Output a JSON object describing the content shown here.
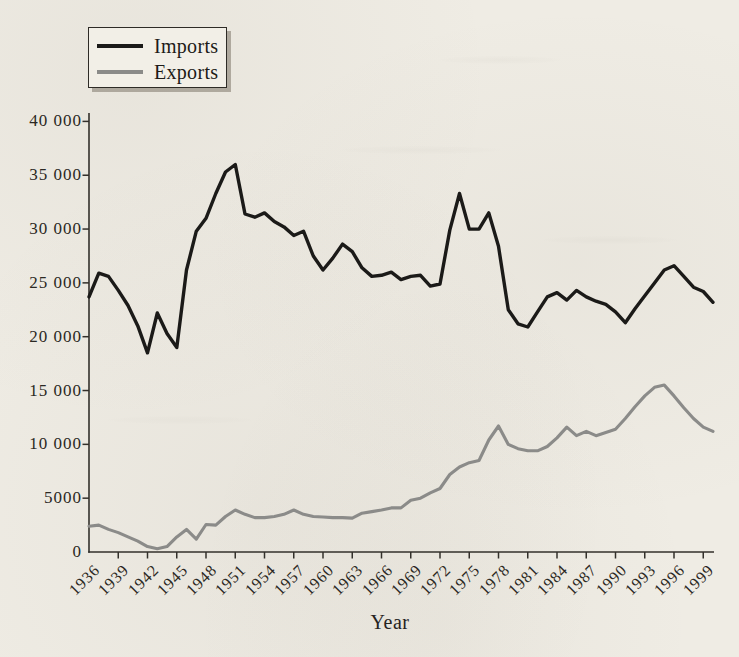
{
  "figure_type": "scanned-book-line-chart",
  "chart_data": {
    "type": "line",
    "title": "",
    "xlabel": "Year",
    "ylabel": "",
    "x_start": 1936,
    "x_end": 2000,
    "x_step": 1,
    "ylim": [
      0,
      40000
    ],
    "grid": false,
    "legend_position": "top-left",
    "y_ticks": [
      40000,
      35000,
      30000,
      25000,
      20000,
      15000,
      10000,
      5000,
      0
    ],
    "y_tick_labels": [
      "40 000",
      "35 000",
      "30 000",
      "25 000",
      "20 000",
      "15 000",
      "10 000",
      "5000",
      "0"
    ],
    "x_tick_years": [
      1936,
      1939,
      1942,
      1945,
      1948,
      1951,
      1954,
      1957,
      1960,
      1963,
      1966,
      1969,
      1972,
      1975,
      1978,
      1981,
      1984,
      1987,
      1990,
      1993,
      1996,
      1999
    ],
    "x_tick_labels": [
      "1936",
      "1939",
      "1942",
      "1945",
      "1948",
      "1951",
      "1954",
      "1957",
      "1960",
      "1963",
      "1966",
      "1969",
      "1972",
      "1975",
      "1978",
      "1981",
      "1984",
      "1987",
      "1990",
      "1993",
      "1996",
      "1999"
    ],
    "series": [
      {
        "name": "Imports",
        "color": "#1b1a18",
        "width": 3.4,
        "values": [
          23700,
          25900,
          25600,
          24300,
          22900,
          21000,
          18500,
          22200,
          20300,
          19000,
          26200,
          29800,
          31000,
          33300,
          35300,
          36000,
          31400,
          31100,
          31500,
          30700,
          30200,
          29400,
          29800,
          27500,
          26200,
          27300,
          28600,
          27900,
          26400,
          25600,
          25700,
          26000,
          25300,
          25600,
          25700,
          24700,
          24900,
          29900,
          33300,
          30000,
          30000,
          31500,
          28400,
          22500,
          21200,
          20900,
          22300,
          23700,
          24100,
          23400,
          24300,
          23700,
          23300,
          23000,
          22300,
          21300,
          22600,
          23800,
          25000,
          26200,
          26600,
          25600,
          24600,
          24200,
          23200
        ]
      },
      {
        "name": "Exports",
        "color": "#8b8b89",
        "width": 3.1,
        "values": [
          2400,
          2500,
          2100,
          1800,
          1400,
          1000,
          500,
          300,
          500,
          1400,
          2100,
          1200,
          2550,
          2500,
          3300,
          3900,
          3500,
          3200,
          3200,
          3300,
          3500,
          3900,
          3500,
          3300,
          3250,
          3200,
          3200,
          3150,
          3600,
          3750,
          3900,
          4100,
          4100,
          4800,
          5000,
          5500,
          5900,
          7200,
          7900,
          8300,
          8500,
          10400,
          11700,
          10000,
          9600,
          9400,
          9400,
          9800,
          10600,
          11600,
          10800,
          11200,
          10800,
          11100,
          11400,
          12400,
          13500,
          14500,
          15300,
          15500,
          14500,
          13400,
          12400,
          11600,
          11200
        ]
      }
    ]
  },
  "colors": {
    "paper": "#efece4",
    "axis": "#33302b",
    "text": "#2b2823",
    "legend_border": "#2e2b26",
    "legend_background": "#f2efe7"
  }
}
